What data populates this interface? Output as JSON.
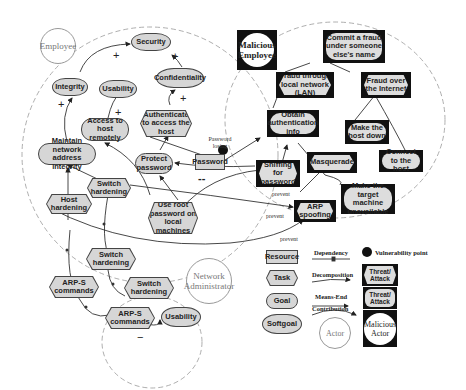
{
  "actors": {
    "employee": "Employee",
    "malicious_employee": "Malicious Employee",
    "network_admin": "Network Administrator"
  },
  "employee_nodes": {
    "security": "Security",
    "integrity": "Integrity",
    "usability": "Usability",
    "confidentiality": "Confidentiality",
    "authenticate": "Authenticate to access the host",
    "access_remote": "Access to host remotely",
    "maintain_integrity": "Maintain network address integrity",
    "protect_password": "Protect password",
    "password": "Password",
    "switch_hardening": "Switch hardening",
    "host_hardening": "Host hardening",
    "use_root": "Use root password on local machines"
  },
  "attacker_nodes": {
    "commit_fraud": "Commit a fraud under someone else's name",
    "fraud_lan": "Fraud through local network (LAN)",
    "fraud_internet": "Fraud over the Internet",
    "obtain_auth": "Obtain authentication info",
    "make_host_down": "Make the host down",
    "connect_host": "Connect to the host",
    "sniffing": "Sniffing for password",
    "masquerade": "Masquerade",
    "arp_spoofing": "ARP spoofing",
    "make_unavailable": "Make the target machine unavailable"
  },
  "admin_nodes": {
    "switch_hardening_1": "Switch hardening",
    "switch_hardening_2": "Switch hardening",
    "arp_commands_1": "ARP-S commands",
    "arp_commands_2": "ARP-S commands",
    "usability": "Usability"
  },
  "annotations": {
    "password_losing": "Password losing",
    "prevent_1": "prevent",
    "prevent_2": "prevent",
    "prevent_3": "prevent",
    "plus": "+",
    "minus": "−",
    "double_minus": "--"
  },
  "legend": {
    "resource": "Resource",
    "task": "Task",
    "goal": "Goal",
    "softgoal": "Softgoal",
    "dependency": "Dependency",
    "decomposition": "Decomposition",
    "means_end": "Means-End",
    "contribution": "Contribution",
    "actor": "Actor",
    "vulnerability": "Vulnerability point",
    "threat_task": "Threat/ Attack",
    "threat_goal": "Threat/ Attack",
    "malicious_actor": "Malicious Actor"
  }
}
